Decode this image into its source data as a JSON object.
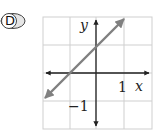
{
  "option": {
    "label": "D"
  },
  "graph": {
    "x_axis_label": "x",
    "y_axis_label": "y",
    "tick_label_x": "1",
    "tick_label_y": "−1",
    "grid": {
      "columns": 4,
      "rows": 4,
      "x_range": [
        -2,
        2
      ],
      "y_range": [
        -2,
        2
      ]
    },
    "line": {
      "equation": "y = x + 1",
      "slope": 1,
      "y_intercept": 1,
      "x_intercept": -1
    },
    "colors": {
      "grid": "#cfcfcf",
      "axes": "#222222",
      "line": "#808080",
      "badge_fill": "#e6e6e6"
    }
  }
}
